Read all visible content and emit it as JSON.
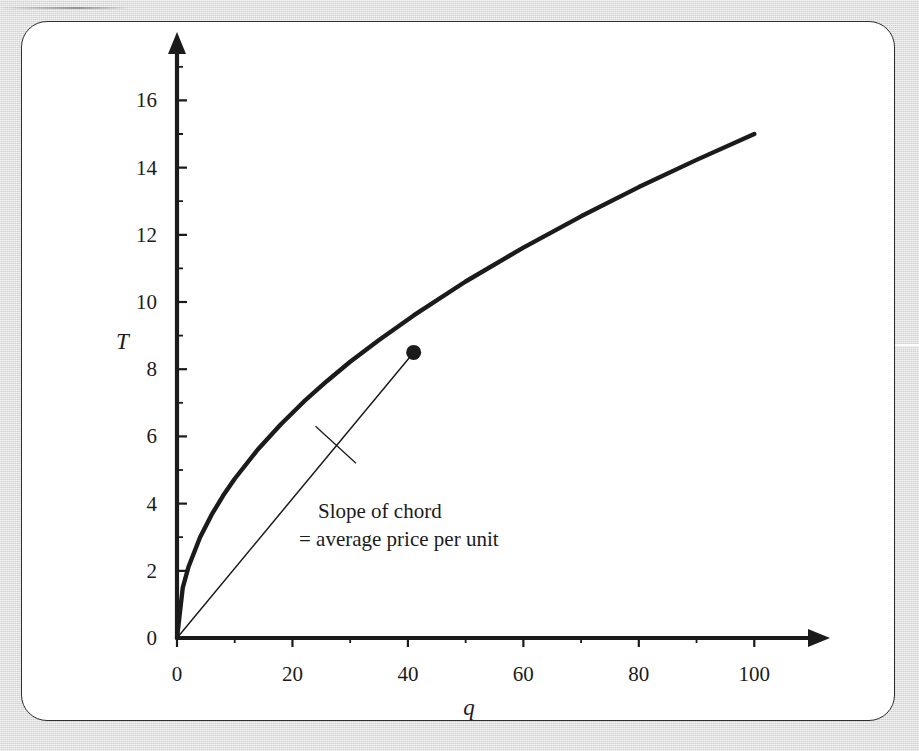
{
  "figure": {
    "card_border_color": "#2e2e2e",
    "card_background": "#ffffff",
    "page_background": "#d7d7d7",
    "ink_color": "#1b1b1b"
  },
  "annotation": {
    "line1": "Slope of chord",
    "line2": "= average price per unit"
  },
  "chart_data": {
    "type": "line",
    "title": "",
    "xlabel": "q",
    "ylabel": "T",
    "xlim": [
      0,
      110
    ],
    "ylim": [
      0,
      17.5
    ],
    "grid": false,
    "legend": null,
    "xticks": [
      0,
      20,
      40,
      60,
      80,
      100
    ],
    "xtick_labels": [
      "0",
      "20",
      "40",
      "60",
      "80",
      "100"
    ],
    "xminor_ticks": [
      10,
      30,
      50,
      70,
      90
    ],
    "yticks": [
      0,
      2,
      4,
      6,
      8,
      10,
      12,
      14,
      16
    ],
    "ytick_labels": [
      "0",
      "2",
      "4",
      "6",
      "8",
      "10",
      "12",
      "14",
      "16"
    ],
    "yminor_ticks": [
      1,
      3,
      5,
      7,
      9,
      11,
      13,
      15,
      17
    ],
    "series": [
      {
        "name": "Total outlay curve T(q)",
        "style": "solid-thick",
        "formula": "T = 1.5*sqrt(q)",
        "x": [
          0,
          1,
          2,
          4,
          6,
          8,
          10,
          14,
          18,
          22,
          26,
          30,
          35,
          41,
          50,
          60,
          70,
          80,
          90,
          100
        ],
        "y": [
          0,
          1.5,
          2.12,
          3.0,
          3.67,
          4.24,
          4.74,
          5.61,
          6.36,
          7.04,
          7.65,
          8.22,
          8.87,
          9.6,
          10.61,
          11.62,
          12.55,
          13.42,
          14.23,
          15.0
        ]
      },
      {
        "name": "Chord from origin",
        "style": "solid-thin",
        "x": [
          0,
          41
        ],
        "y": [
          0,
          8.5
        ]
      }
    ],
    "points": [
      {
        "name": "chord-endpoint",
        "x": 41,
        "y": 8.5
      }
    ],
    "annotations": [
      {
        "text": "Slope of chord = average price per unit",
        "x": 55,
        "y": 4.6,
        "leader_from": {
          "x": 24,
          "y": 6.3
        },
        "leader_to": {
          "x": 31,
          "y": 5.2
        }
      }
    ]
  }
}
